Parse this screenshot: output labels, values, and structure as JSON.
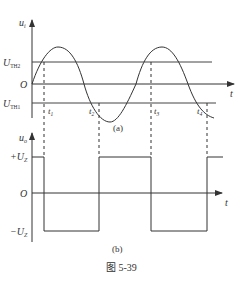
{
  "figure": {
    "caption": "图 5-39",
    "colors": {
      "line": "#3a3a3a",
      "background": "#ffffff"
    }
  },
  "panel_a": {
    "label": "(a)",
    "y_axis_label": "u",
    "y_axis_sub": "i",
    "x_axis_label": "t",
    "levels": [
      {
        "name": "U",
        "sub": "TH2"
      },
      {
        "name": "O",
        "sub": ""
      },
      {
        "name": "U",
        "sub": "TH1"
      }
    ],
    "time_marks": [
      {
        "name": "t",
        "sub": "1"
      },
      {
        "name": "t",
        "sub": "2"
      },
      {
        "name": "t",
        "sub": "3"
      },
      {
        "name": "t",
        "sub": "4"
      }
    ]
  },
  "panel_b": {
    "label": "(b)",
    "y_axis_label": "u",
    "y_axis_sub": "o",
    "x_axis_label": "t",
    "levels": [
      {
        "name": "+U",
        "sub": "Z"
      },
      {
        "name": "O",
        "sub": ""
      },
      {
        "name": "−U",
        "sub": "Z"
      }
    ]
  }
}
